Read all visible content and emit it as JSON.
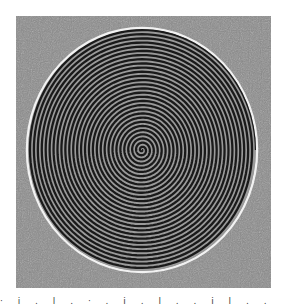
{
  "figure": {
    "background": "noisy gray texture",
    "colors": {
      "background": "#8a8a8a",
      "spiral_dark": "#1a1a1a",
      "spiral_light": "#bdbdbd",
      "rim": "#f0f0f0"
    }
  },
  "caption": {
    "text": "· i . l .  ·  . i . l .   . i  l   .  .  .   .  i   l   l   ."
  }
}
